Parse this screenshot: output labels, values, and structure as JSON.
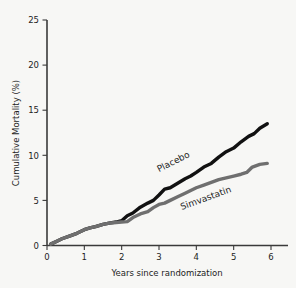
{
  "chart_data": {
    "type": "line",
    "title": "",
    "subtitle": "",
    "xlabel": "Years since randomization",
    "ylabel": "Cumulative Mortality (%)",
    "xlim": [
      0,
      6.4
    ],
    "ylim": [
      0,
      25
    ],
    "xticks": [
      "0",
      "1",
      "2",
      "3",
      "4",
      "5",
      "6"
    ],
    "xtick_values": [
      0,
      1,
      2,
      3,
      4,
      5,
      6
    ],
    "yticks": [
      "0",
      "5",
      "10",
      "15",
      "20",
      "25"
    ],
    "ytick_values": [
      0,
      5,
      10,
      15,
      20,
      25
    ],
    "grid": false,
    "legend_position": "inline-curve-labels",
    "series": [
      {
        "name": "Placebo",
        "color": "#111111",
        "label_rotation_deg": -27,
        "x": [
          0.1,
          0.25,
          0.4,
          0.6,
          0.8,
          1.0,
          1.15,
          1.3,
          1.5,
          1.7,
          1.85,
          2.0,
          2.15,
          2.3,
          2.5,
          2.7,
          2.85,
          3.0,
          3.15,
          3.3,
          3.5,
          3.7,
          3.85,
          4.0,
          4.2,
          4.4,
          4.6,
          4.8,
          5.0,
          5.2,
          5.4,
          5.55,
          5.7,
          5.9
        ],
        "y": [
          0.15,
          0.45,
          0.75,
          1.05,
          1.35,
          1.75,
          1.95,
          2.1,
          2.35,
          2.5,
          2.6,
          2.75,
          3.3,
          3.6,
          4.25,
          4.7,
          5.0,
          5.6,
          6.25,
          6.4,
          6.9,
          7.4,
          7.7,
          8.1,
          8.7,
          9.1,
          9.8,
          10.4,
          10.8,
          11.5,
          12.1,
          12.4,
          13.0,
          13.5
        ]
      },
      {
        "name": "Simvastatin",
        "color": "#6f6f6f",
        "label_rotation_deg": -20,
        "x": [
          0.1,
          0.25,
          0.4,
          0.6,
          0.8,
          1.0,
          1.15,
          1.3,
          1.5,
          1.7,
          1.85,
          2.0,
          2.15,
          2.3,
          2.5,
          2.7,
          2.85,
          3.0,
          3.15,
          3.3,
          3.5,
          3.7,
          3.85,
          4.0,
          4.2,
          4.4,
          4.6,
          4.8,
          5.0,
          5.2,
          5.35,
          5.5,
          5.7,
          5.9
        ],
        "y": [
          0.15,
          0.45,
          0.75,
          1.05,
          1.35,
          1.75,
          1.95,
          2.1,
          2.35,
          2.5,
          2.55,
          2.6,
          2.65,
          3.1,
          3.5,
          3.75,
          4.2,
          4.55,
          4.7,
          5.0,
          5.4,
          5.8,
          6.1,
          6.4,
          6.7,
          7.0,
          7.3,
          7.5,
          7.7,
          7.9,
          8.1,
          8.7,
          9.0,
          9.1
        ]
      }
    ]
  },
  "colors": {
    "background": "#f7f7f5",
    "axis": "#3a3a3a",
    "text": "#1d1d1d",
    "placebo": "#111111",
    "simvastatin": "#6f6f6f"
  }
}
